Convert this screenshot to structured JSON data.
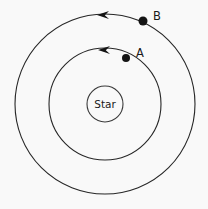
{
  "figure": {
    "background_color": "#f9f9f9",
    "stroke_color": "#262626",
    "marker_color": "#141414",
    "center_label": "Star"
  },
  "chart_data": {
    "type": "scatter",
    "title": "",
    "subtitle": "",
    "xlabel": "",
    "ylabel": "",
    "grid": false,
    "legend": null,
    "center": {
      "x": 105,
      "y": 104,
      "label": "Star",
      "radius": 18
    },
    "orbits": [
      {
        "name": "inner-orbit",
        "body": "A",
        "radius": 56,
        "direction": "counter-clockwise"
      },
      {
        "name": "outer-orbit",
        "body": "B",
        "radius": 90,
        "direction": "counter-clockwise"
      }
    ],
    "series": [
      {
        "name": "A",
        "label": "A",
        "orbit": "inner-orbit",
        "orbit_radius": 56,
        "x": 126,
        "y": 58,
        "marker_radius": 4,
        "label_x": 136,
        "label_y": 57
      },
      {
        "name": "B",
        "label": "B",
        "orbit": "outer-orbit",
        "orbit_radius": 90,
        "x": 143,
        "y": 21,
        "marker_radius": 4.5,
        "label_x": 153,
        "label_y": 20
      }
    ],
    "arrows": [
      {
        "name": "inner-direction-arrow",
        "x": 104,
        "y": 50,
        "points": "left",
        "orbit": "inner-orbit"
      },
      {
        "name": "outer-direction-arrow",
        "x": 103,
        "y": 15,
        "points": "left",
        "orbit": "outer-orbit"
      }
    ]
  },
  "labels": {
    "body_a": "A",
    "body_b": "B",
    "star": "Star"
  }
}
